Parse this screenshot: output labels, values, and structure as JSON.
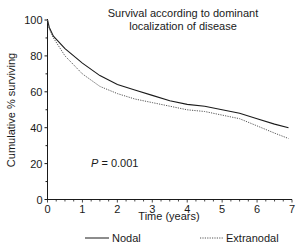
{
  "chart_data": {
    "type": "line",
    "title": "Survival according to dominant localization of disease",
    "title_lines": [
      "Survival according to dominant",
      "localization of disease"
    ],
    "xlabel": "Time (years)",
    "ylabel": "Cumulative % surviving",
    "xlim": [
      0,
      7
    ],
    "ylim": [
      0,
      100
    ],
    "xticks": [
      0,
      1,
      2,
      3,
      4,
      5,
      6,
      7
    ],
    "yticks": [
      0,
      20,
      40,
      60,
      80,
      100
    ],
    "grid": false,
    "legend_position": "bottom",
    "annotation": {
      "label": "P",
      "text": " = 0.001",
      "x": 1.2,
      "y": 23
    },
    "series": [
      {
        "name": "Nodal",
        "style": "solid",
        "x": [
          0,
          0.05,
          0.17,
          0.5,
          1,
          1.5,
          2,
          2.5,
          3,
          3.5,
          4,
          4.5,
          5,
          5.5,
          6,
          6.5,
          6.9
        ],
        "y": [
          100,
          96,
          91,
          84,
          76,
          69,
          64,
          61,
          58,
          55,
          53,
          52,
          50,
          48,
          45,
          42,
          40
        ]
      },
      {
        "name": "Extranodal",
        "style": "dotted",
        "x": [
          0,
          0.05,
          0.17,
          0.5,
          1,
          1.5,
          2,
          2.5,
          3,
          3.5,
          4,
          4.5,
          5,
          5.5,
          6,
          6.5,
          6.9
        ],
        "y": [
          100,
          95,
          90,
          80,
          70,
          63,
          59,
          56,
          54,
          52,
          50,
          49,
          47,
          45,
          41,
          37,
          34
        ]
      }
    ]
  },
  "title": {
    "line1": "Survival according to dominant",
    "line2": "localization of disease"
  },
  "axes": {
    "xlabel": "Time (years)",
    "ylabel": "Cumulative % surviving"
  },
  "legend": {
    "nodal": "Nodal",
    "extranodal": "Extranodal"
  },
  "annotation": {
    "p_label": "P",
    "p_value": " = 0.001"
  }
}
